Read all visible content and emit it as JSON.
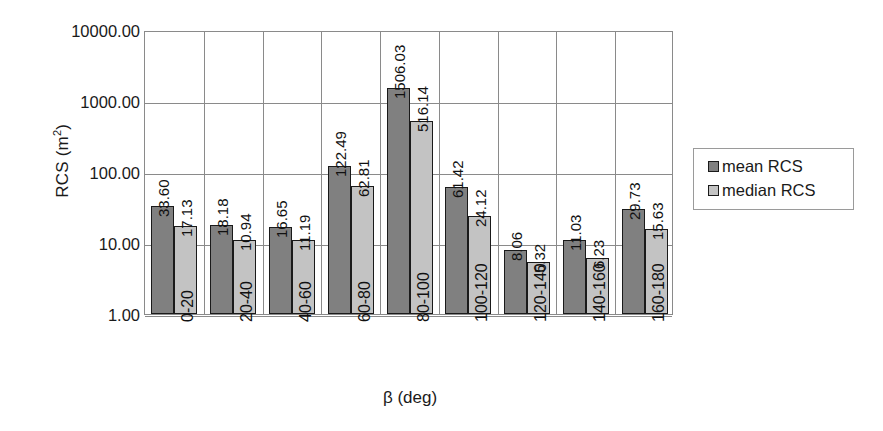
{
  "chart_data": {
    "type": "bar",
    "title": "",
    "xlabel": "β (deg)",
    "ylabel": "RCS (m²)",
    "ylabel_base": "RCS (m",
    "ylabel_sup": "2",
    "ylabel_tail": ")",
    "yscale": "log",
    "ylim": [
      1,
      10000
    ],
    "grid": true,
    "legend_position": "right",
    "ytick_labels": [
      "10000.00",
      "1000.00",
      "100.00",
      "10.00",
      "1.00"
    ],
    "ytick_values": [
      10000,
      1000,
      100,
      10,
      1
    ],
    "categories": [
      "0-20",
      "20-40",
      "40-60",
      "60-80",
      "80-100",
      "100-120",
      "120-140",
      "140-160",
      "160-180"
    ],
    "series": [
      {
        "name": "mean RCS",
        "color": "#808080",
        "values": [
          33.6,
          18.18,
          16.65,
          122.49,
          1506.03,
          61.42,
          8.06,
          11.03,
          29.73
        ],
        "labels": [
          "33.60",
          "18.18",
          "16.65",
          "122.49",
          "1506.03",
          "61.42",
          "8.06",
          "11.03",
          "29.73"
        ]
      },
      {
        "name": "median RCS",
        "color": "#c3c3c3",
        "values": [
          17.13,
          10.94,
          11.19,
          62.81,
          516.14,
          24.12,
          5.32,
          6.23,
          15.63
        ],
        "labels": [
          "17.13",
          "10.94",
          "11.19",
          "62.81",
          "516.14",
          "24.12",
          "5.32",
          "6.23",
          "15.63"
        ]
      }
    ]
  },
  "legend": {
    "items": [
      {
        "label": "mean RCS",
        "color": "#808080"
      },
      {
        "label": "median RCS",
        "color": "#c3c3c3"
      }
    ]
  }
}
